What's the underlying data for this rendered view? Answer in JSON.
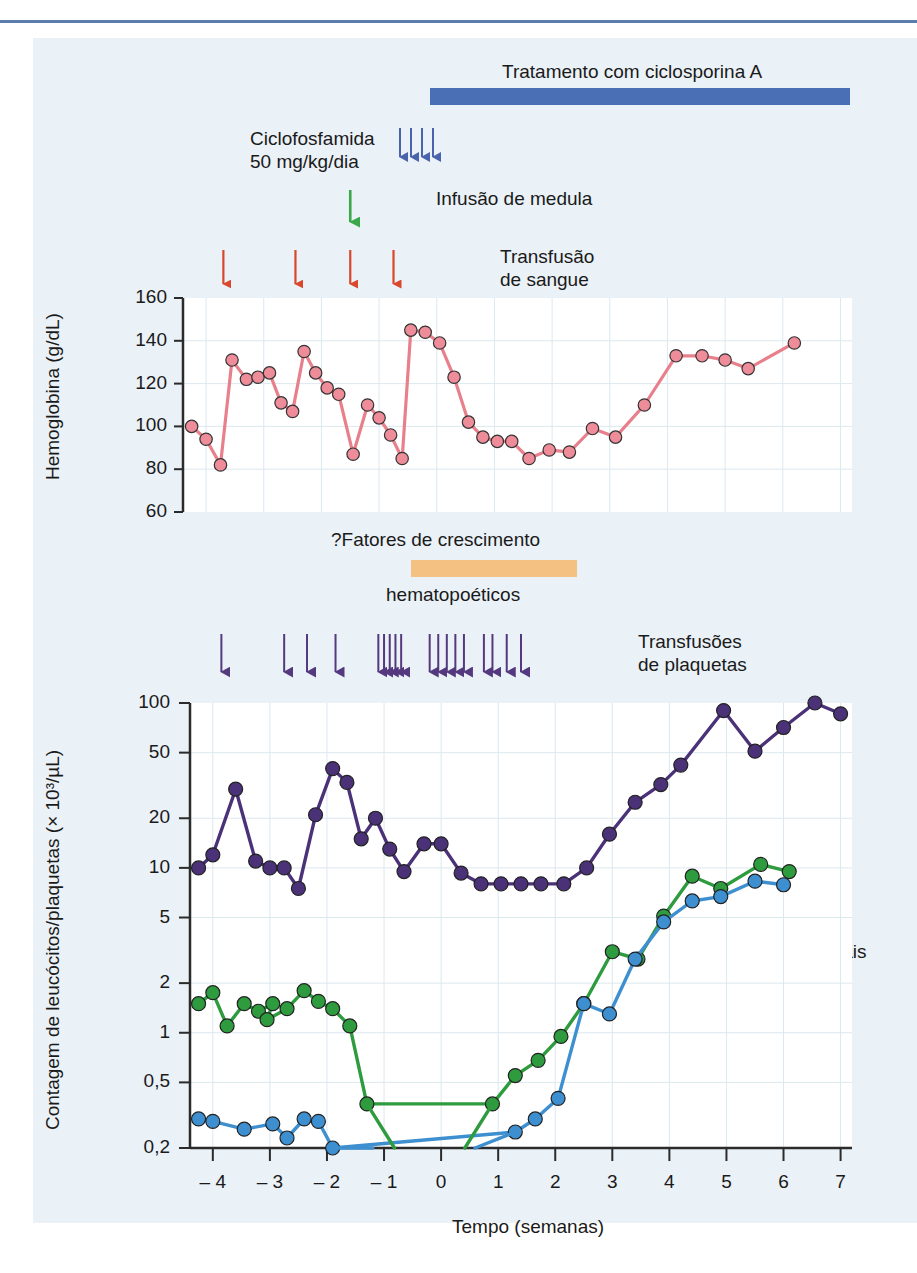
{
  "figure": {
    "background": "#eaf1f7",
    "rule_color": "#5b7cad"
  },
  "annotations": {
    "cyclosporin_label": "Tratamento com ciclosporina A",
    "cyclosporin_bar_color": "#4a6fb5",
    "cyclophosphamide_line1": "Ciclofosfamida",
    "cyclophosphamide_line2": "50 mg/kg/dia",
    "cyclophosphamide_arrow_color": "#4a63ad",
    "marrow_infusion_label": "Infusão de medula",
    "marrow_infusion_arrow_color": "#3aa84a",
    "blood_transfusion_line1": "Transfusão",
    "blood_transfusion_line2": "de sangue",
    "blood_transfusion_arrow_color": "#d9472c",
    "growth_factors_line1": "?Fatores de crescimento",
    "growth_factors_line2": "hematopoéticos",
    "growth_factors_bar_color": "#f5c183",
    "platelet_transfusion_line1": "Transfusões",
    "platelet_transfusion_line2": "de plaquetas",
    "platelet_transfusion_arrow_color": "#54397f"
  },
  "chart_data": [
    {
      "type": "line",
      "id": "hemoglobin",
      "title": "",
      "ylabel": "Hemoglobina (g/dL)",
      "xlabel": "",
      "ylim": [
        60,
        160
      ],
      "xlim": [
        -4.4,
        7.2
      ],
      "yticks": [
        60,
        80,
        100,
        120,
        140,
        160
      ],
      "ytick_labels": [
        "60",
        "80",
        "100",
        "120",
        "140",
        "160"
      ],
      "grid": true,
      "series": [
        {
          "name": "Hemoglobina",
          "color": "#e8808c",
          "marker_color": "#ee8d99",
          "points": [
            [
              -4.25,
              100
            ],
            [
              -4.0,
              94
            ],
            [
              -3.75,
              82
            ],
            [
              -3.55,
              131
            ],
            [
              -3.3,
              122
            ],
            [
              -3.1,
              123
            ],
            [
              -2.9,
              125
            ],
            [
              -2.7,
              111
            ],
            [
              -2.5,
              107
            ],
            [
              -2.3,
              135
            ],
            [
              -2.1,
              125
            ],
            [
              -1.9,
              118
            ],
            [
              -1.7,
              115
            ],
            [
              -1.45,
              87
            ],
            [
              -1.2,
              110
            ],
            [
              -1.0,
              104
            ],
            [
              -0.8,
              96
            ],
            [
              -0.6,
              85
            ],
            [
              -0.45,
              145
            ],
            [
              -0.2,
              144
            ],
            [
              0.05,
              139
            ],
            [
              0.3,
              123
            ],
            [
              0.55,
              102
            ],
            [
              0.8,
              95
            ],
            [
              1.05,
              93
            ],
            [
              1.3,
              93
            ],
            [
              1.6,
              85
            ],
            [
              1.95,
              89
            ],
            [
              2.3,
              88
            ],
            [
              2.7,
              99
            ],
            [
              3.1,
              95
            ],
            [
              3.6,
              110
            ],
            [
              4.15,
              133
            ],
            [
              4.6,
              133
            ],
            [
              5.0,
              131
            ],
            [
              5.4,
              127
            ],
            [
              6.2,
              139
            ]
          ]
        }
      ],
      "event_arrows": {
        "blood_transfusions": [
          -3.7,
          -2.45,
          -1.5,
          -0.75
        ],
        "marrow_infusion": [
          -1.5
        ],
        "cyclophosphamide": [
          -2.75,
          -2.65,
          -2.55,
          -2.45
        ]
      }
    },
    {
      "type": "line",
      "id": "counts",
      "title": "",
      "ylabel": "Contagem de leucócitos/plaquetas (× 10³/µL)",
      "xlabel": "Tempo (semanas)",
      "yscale": "log",
      "ylim": [
        0.2,
        100
      ],
      "xlim": [
        -4.4,
        7.2
      ],
      "yticks": [
        0.2,
        0.5,
        1,
        2,
        5,
        10,
        20,
        50,
        100
      ],
      "ytick_labels": [
        "0,2",
        "0,5",
        "1",
        "2",
        "5",
        "10",
        "20",
        "50",
        "100"
      ],
      "xticks": [
        -4,
        -3,
        -2,
        -1,
        0,
        1,
        2,
        3,
        4,
        5,
        6,
        7
      ],
      "xtick_labels": [
        "– 4",
        "– 3",
        "– 2",
        "– 1",
        "0",
        "1",
        "2",
        "3",
        "4",
        "5",
        "6",
        "7"
      ],
      "grid": true,
      "series": [
        {
          "name": "Plaquetas",
          "color": "#4b3178",
          "marker_color": "#4b3178",
          "label": "Plaquetas",
          "points": [
            [
              -4.25,
              10
            ],
            [
              -4.0,
              12
            ],
            [
              -3.6,
              30
            ],
            [
              -3.25,
              11
            ],
            [
              -3.0,
              10
            ],
            [
              -2.75,
              10
            ],
            [
              -2.5,
              7.5
            ],
            [
              -2.2,
              21
            ],
            [
              -1.9,
              40
            ],
            [
              -1.65,
              33
            ],
            [
              -1.4,
              15
            ],
            [
              -1.15,
              20
            ],
            [
              -0.9,
              13
            ],
            [
              -0.65,
              9.5
            ],
            [
              -0.3,
              14
            ],
            [
              0.0,
              14
            ],
            [
              0.35,
              9.3
            ],
            [
              0.7,
              8
            ],
            [
              1.05,
              8
            ],
            [
              1.4,
              8
            ],
            [
              1.75,
              8
            ],
            [
              2.15,
              8
            ],
            [
              2.55,
              10
            ],
            [
              2.95,
              16
            ],
            [
              3.4,
              25
            ],
            [
              3.85,
              32
            ],
            [
              4.2,
              42
            ],
            [
              4.95,
              90
            ],
            [
              5.5,
              51
            ],
            [
              6.0,
              71
            ],
            [
              6.55,
              100
            ],
            [
              7.0,
              86
            ]
          ]
        },
        {
          "name": "Leucócitos totais",
          "color": "#2e9b3e",
          "marker_color": "#2e9b3e",
          "label": "Leucócitos totais",
          "points": [
            [
              -4.25,
              1.5
            ],
            [
              -4.0,
              1.75
            ],
            [
              -3.75,
              1.1
            ],
            [
              -3.45,
              1.5
            ],
            [
              -3.2,
              1.35
            ],
            [
              -2.95,
              1.5
            ],
            [
              -3.05,
              1.2
            ],
            [
              -2.7,
              1.4
            ],
            [
              -2.4,
              1.8
            ],
            [
              -2.15,
              1.55
            ],
            [
              -1.9,
              1.4
            ],
            [
              -1.6,
              1.1
            ],
            [
              -1.3,
              0.37
            ],
            [
              0.9,
              0.37
            ],
            [
              1.3,
              0.55
            ],
            [
              1.7,
              0.68
            ],
            [
              2.1,
              0.95
            ],
            [
              2.5,
              1.5
            ],
            [
              3.0,
              3.1
            ],
            [
              3.45,
              2.8
            ],
            [
              3.9,
              5.1
            ],
            [
              4.4,
              8.9
            ],
            [
              4.9,
              7.5
            ],
            [
              5.6,
              10.5
            ],
            [
              6.1,
              9.5
            ]
          ]
        },
        {
          "name": "Neutrófilos totais",
          "color": "#3d8fd0",
          "marker_color": "#3d8fd0",
          "label": "Neutrófilos totais",
          "points": [
            [
              -4.25,
              0.3
            ],
            [
              -4.0,
              0.29
            ],
            [
              -3.45,
              0.26
            ],
            [
              -2.95,
              0.28
            ],
            [
              -2.7,
              0.23
            ],
            [
              -2.4,
              0.3
            ],
            [
              -2.15,
              0.29
            ],
            [
              -1.9,
              0.2
            ],
            [
              1.3,
              0.25
            ],
            [
              1.65,
              0.3
            ],
            [
              2.05,
              0.4
            ],
            [
              2.5,
              1.5
            ],
            [
              2.95,
              1.3
            ],
            [
              3.4,
              2.8
            ],
            [
              3.9,
              4.7
            ],
            [
              4.4,
              6.3
            ],
            [
              4.9,
              6.7
            ],
            [
              5.5,
              8.3
            ],
            [
              6.0,
              7.9
            ]
          ]
        }
      ],
      "event_arrows": {
        "platelet_transfusions": [
          -3.85,
          -2.75,
          -2.35,
          -1.85,
          -1.1,
          -1.0,
          -0.9,
          -0.8,
          -0.7,
          -0.2,
          -0.05,
          0.1,
          0.25,
          0.4,
          0.75,
          0.9,
          1.15,
          1.4
        ]
      }
    }
  ]
}
